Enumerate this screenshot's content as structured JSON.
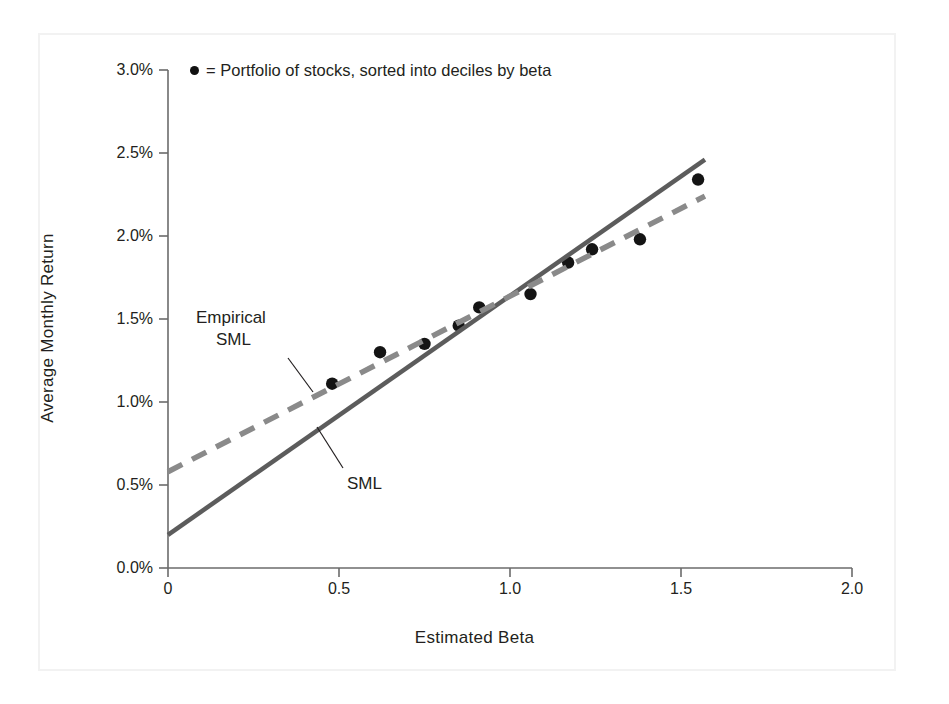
{
  "chart_data": {
    "type": "scatter",
    "title": "",
    "xlabel": "Estimated Beta",
    "ylabel": "Average Monthly Return",
    "xlim": [
      0,
      2.0
    ],
    "ylim": [
      0,
      3.0
    ],
    "xticks": [
      "0",
      "0.5",
      "1.0",
      "1.5",
      "2.0"
    ],
    "xtick_values": [
      0,
      0.5,
      1.0,
      1.5,
      2.0
    ],
    "yticks": [
      "0.0%",
      "0.5%",
      "1.0%",
      "1.5%",
      "2.0%",
      "2.5%",
      "3.0%"
    ],
    "ytick_values": [
      0.0,
      0.5,
      1.0,
      1.5,
      2.0,
      2.5,
      3.0
    ],
    "grid": false,
    "legend_position": "top-inside-left",
    "legend": [
      {
        "marker": "filled-circle",
        "label": "= Portfolio of stocks, sorted into deciles by beta"
      }
    ],
    "series": [
      {
        "name": "Portfolio of stocks, sorted into deciles by beta",
        "type": "scatter",
        "marker": "filled-circle",
        "color": "#141414",
        "points": [
          {
            "x": 0.48,
            "y": 1.11
          },
          {
            "x": 0.62,
            "y": 1.3
          },
          {
            "x": 0.75,
            "y": 1.35
          },
          {
            "x": 0.85,
            "y": 1.46
          },
          {
            "x": 0.91,
            "y": 1.57
          },
          {
            "x": 1.06,
            "y": 1.65
          },
          {
            "x": 1.17,
            "y": 1.84
          },
          {
            "x": 1.24,
            "y": 1.92
          },
          {
            "x": 1.38,
            "y": 1.98
          },
          {
            "x": 1.55,
            "y": 2.34
          }
        ]
      },
      {
        "name": "SML",
        "type": "line",
        "style": "solid",
        "color": "#5c5c5c",
        "x": [
          0.0,
          1.57
        ],
        "y": [
          0.2,
          2.46
        ]
      },
      {
        "name": "Empirical SML",
        "type": "line",
        "style": "dashed",
        "color": "#8a8a8a",
        "x": [
          0.0,
          1.57
        ],
        "y": [
          0.58,
          2.24
        ]
      }
    ],
    "annotations": [
      {
        "text_line1": "Empirical",
        "text_line2": "SML",
        "points_to": {
          "x": 0.63,
          "y": 1.18
        }
      },
      {
        "text_line1": "SML",
        "points_to": {
          "x": 0.74,
          "y": 1.3
        }
      }
    ]
  },
  "colors": {
    "sml_line": "#5c5c5c",
    "empirical_sml_line": "#8a8a8a",
    "marker": "#141414",
    "axis": "#6b6b6b",
    "text": "#231f20",
    "frame": "#f2f2f2",
    "background": "#ffffff"
  }
}
